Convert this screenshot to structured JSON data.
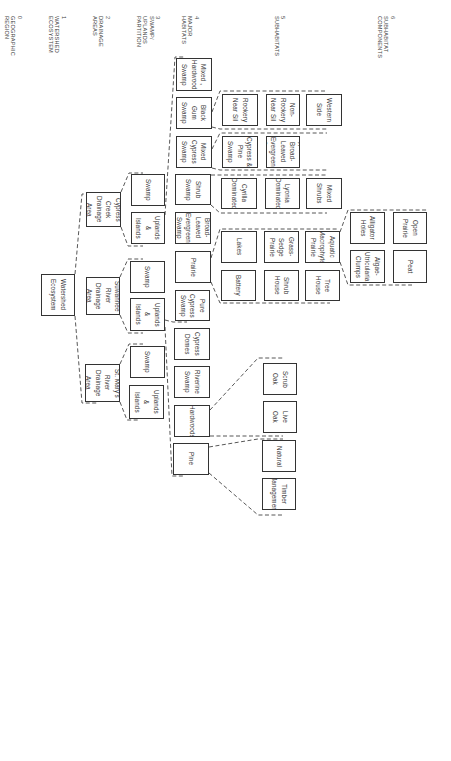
{
  "levels": [
    {
      "label": "0\nGEOGRAPHIC\nREGION",
      "x": 3
    },
    {
      "label": "1\nWATERSHED\nECOSYSTEM",
      "x": 47
    },
    {
      "label": "2\nDRAINAGE\nAREAS",
      "x": 91
    },
    {
      "label": "3\nSWAMP/\nUPLANDS\nPARTITION",
      "x": 135
    },
    {
      "label": "4\nMAJOR\nHABITATS",
      "x": 180
    },
    {
      "label": "5\nSUBHABITATS",
      "x": 273
    },
    {
      "label": "6\nSUBHABITAT\nCOMPONENTS",
      "x": 376
    }
  ],
  "nodes": [
    {
      "id": "watershed",
      "label": "Watershed\nEcosystem",
      "x": 41,
      "y": 274,
      "w": 34,
      "h": 42
    },
    {
      "id": "cypress-creek",
      "label": "Cypress\nCreek\nDrainage Area",
      "x": 86,
      "y": 192,
      "w": 35,
      "h": 35
    },
    {
      "id": "suwannee",
      "label": "Suwannee\nRiver\nDrainage Area",
      "x": 86,
      "y": 277,
      "w": 34,
      "h": 38
    },
    {
      "id": "st-marys",
      "label": "St. Mary's\nRiver\nDrainage Area",
      "x": 85,
      "y": 364,
      "w": 35,
      "h": 38
    },
    {
      "id": "cc-swamp",
      "label": "Swamp",
      "x": 131,
      "y": 174,
      "w": 34,
      "h": 32
    },
    {
      "id": "cc-uplands",
      "label": "Uplands\n&\nIslands",
      "x": 131,
      "y": 212,
      "w": 34,
      "h": 32
    },
    {
      "id": "sr-swamp",
      "label": "Swamp",
      "x": 130,
      "y": 261,
      "w": 35,
      "h": 32
    },
    {
      "id": "sr-uplands",
      "label": "Uplands\n&\nIslands",
      "x": 130,
      "y": 298,
      "w": 35,
      "h": 33
    },
    {
      "id": "sm-swamp",
      "label": "Swamp",
      "x": 130,
      "y": 346,
      "w": 35,
      "h": 32
    },
    {
      "id": "sm-uplands",
      "label": "Uplands\n&\nIslands",
      "x": 129,
      "y": 385,
      "w": 35,
      "h": 34
    },
    {
      "id": "mixed-hardwood",
      "label": "Mixed ,\nHardwood\nSwamp",
      "x": 176,
      "y": 58,
      "w": 36,
      "h": 33
    },
    {
      "id": "black-gum",
      "label": "Black Gum\nSwamp",
      "x": 176,
      "y": 97,
      "w": 36,
      "h": 32
    },
    {
      "id": "mixed-cypress",
      "label": "Mixed\nCypress\nSwamp",
      "x": 176,
      "y": 136,
      "w": 36,
      "h": 32
    },
    {
      "id": "shrub-swamp",
      "label": "Shrub\nSwamp",
      "x": 175,
      "y": 174,
      "w": 36,
      "h": 31
    },
    {
      "id": "broad-leaved",
      "label": "Broad-Leaved\nEvergreen\nSwamp",
      "x": 175,
      "y": 212,
      "w": 36,
      "h": 32
    },
    {
      "id": "prairie",
      "label": "Prairie",
      "x": 175,
      "y": 251,
      "w": 36,
      "h": 32
    },
    {
      "id": "pure-cypress",
      "label": "Pure\nCypress\nSwamp",
      "x": 175,
      "y": 290,
      "w": 35,
      "h": 31
    },
    {
      "id": "cypress-domes",
      "label": "Cypress\nDomes",
      "x": 174,
      "y": 328,
      "w": 36,
      "h": 32
    },
    {
      "id": "riverine",
      "label": "Riverine\nSwamp",
      "x": 174,
      "y": 366,
      "w": 36,
      "h": 32
    },
    {
      "id": "hardwoods",
      "label": "Hardwoods",
      "x": 174,
      "y": 405,
      "w": 36,
      "h": 32
    },
    {
      "id": "pine",
      "label": "Pine",
      "x": 173,
      "y": 443,
      "w": 36,
      "h": 32
    },
    {
      "id": "rookery",
      "label": "Rookery\nNear Sil",
      "x": 222,
      "y": 94,
      "w": 36,
      "h": 32
    },
    {
      "id": "non-rookery",
      "label": "Non-Rookery\nNear Sil",
      "x": 266,
      "y": 94,
      "w": 34,
      "h": 32
    },
    {
      "id": "western-side",
      "label": "Western\nSide",
      "x": 306,
      "y": 94,
      "w": 36,
      "h": 32
    },
    {
      "id": "cypress-pine",
      "label": "Cypress &\nPine Swamp",
      "x": 222,
      "y": 136,
      "w": 36,
      "h": 32
    },
    {
      "id": "cypress-broad",
      "label": "Cypress &\nBroad-Leaved\nEvergreen\nSwamp",
      "x": 266,
      "y": 136,
      "w": 34,
      "h": 32
    },
    {
      "id": "cyrilla",
      "label": "Cyrilla\nDominated",
      "x": 221,
      "y": 178,
      "w": 36,
      "h": 31
    },
    {
      "id": "lyonia",
      "label": "Lyonia\nDominated",
      "x": 265,
      "y": 178,
      "w": 35,
      "h": 31
    },
    {
      "id": "mixed-shrubs",
      "label": "Mixed\nShrubs",
      "x": 306,
      "y": 178,
      "w": 36,
      "h": 31
    },
    {
      "id": "lakes",
      "label": "Lakes",
      "x": 221,
      "y": 231,
      "w": 36,
      "h": 32
    },
    {
      "id": "grass-sedge",
      "label": "Grass-Sedge\nPrairie",
      "x": 264,
      "y": 231,
      "w": 35,
      "h": 32
    },
    {
      "id": "aquatic-macrophyte",
      "label": "Aquatic\nMacrophyte\nPrairie",
      "x": 305,
      "y": 231,
      "w": 35,
      "h": 32
    },
    {
      "id": "battery",
      "label": "Battery",
      "x": 221,
      "y": 270,
      "w": 35,
      "h": 31
    },
    {
      "id": "shrub-house",
      "label": "Shrub\nHouse",
      "x": 264,
      "y": 270,
      "w": 35,
      "h": 31
    },
    {
      "id": "tree-house",
      "label": "Tree\nHouse",
      "x": 305,
      "y": 270,
      "w": 35,
      "h": 31
    },
    {
      "id": "alligator-holes",
      "label": "Alligator\nHoles",
      "x": 350,
      "y": 212,
      "w": 35,
      "h": 32
    },
    {
      "id": "open-prairie",
      "label": "Open\nPrairie",
      "x": 393,
      "y": 212,
      "w": 34,
      "h": 32
    },
    {
      "id": "algae-utricularia",
      "label": "Algae-\nUtricularia\nClumps",
      "x": 350,
      "y": 250,
      "w": 35,
      "h": 33
    },
    {
      "id": "peat",
      "label": "Peat",
      "x": 393,
      "y": 250,
      "w": 34,
      "h": 33
    },
    {
      "id": "scrub-oak",
      "label": "Scrub\nOak",
      "x": 263,
      "y": 363,
      "w": 34,
      "h": 32
    },
    {
      "id": "live-oak",
      "label": "Live\nOak",
      "x": 263,
      "y": 401,
      "w": 34,
      "h": 32
    },
    {
      "id": "natural",
      "label": "Natural",
      "x": 262,
      "y": 440,
      "w": 34,
      "h": 32
    },
    {
      "id": "timber-management",
      "label": "Timber\nManagement",
      "x": 262,
      "y": 478,
      "w": 34,
      "h": 32
    }
  ],
  "connectors": [
    "M75 274 L82 194 L87 194",
    "M75 316 L82 403 L98 403",
    "M121 192 L129 173 L143 173",
    "M121 227 L128 246 L143 246",
    "M120 277 L128 259 L143 259",
    "M120 315 L128 333 L143 333",
    "M120 364 L129 344 L143 344",
    "M120 402 L127 420 L140 420",
    "M165 215 L175 57 L185 57",
    "M165 320 L173 322 L187 322",
    "M165 327 L172 476 L185 476",
    "M212 112 L220 91 L327 91",
    "M212 127 L220 129 L327 129",
    "M212 149 L220 133 L327 133",
    "M212 168 L220 170 L327 170",
    "M211 175 L220 175 L327 175",
    "M211 205 L220 213 L327 213",
    "M211 258 L220 229 L338 229",
    "M211 282 L220 303 L330 303",
    "M340 232 L348 210 L428 210",
    "M340 262 L348 285 L412 285",
    "M210 410 L258 358 L283 358",
    "M210 436 L258 436 L283 436",
    "M209 447 L258 439 L283 439",
    "M209 473 L258 515 L283 515"
  ]
}
